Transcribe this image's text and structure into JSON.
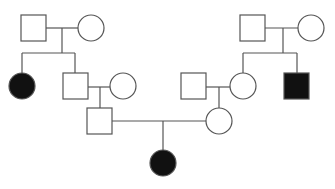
{
  "diagram": {
    "type": "pedigree-chart",
    "colors": {
      "affected": "#111111",
      "unaffected": "#ffffff",
      "stroke": "#555555"
    },
    "individuals": [
      {
        "id": "I-1",
        "sex": "male",
        "affected": false,
        "generation": 1,
        "x": 21,
        "y": 15,
        "size": 25
      },
      {
        "id": "I-2",
        "sex": "female",
        "affected": false,
        "generation": 1,
        "cx": 91,
        "cy": 28,
        "r": 13
      },
      {
        "id": "I-3",
        "sex": "male",
        "affected": false,
        "generation": 1,
        "x": 240,
        "y": 15,
        "size": 25
      },
      {
        "id": "I-4",
        "sex": "female",
        "affected": false,
        "generation": 1,
        "cx": 311,
        "cy": 28,
        "r": 13
      },
      {
        "id": "II-1",
        "sex": "female",
        "affected": true,
        "generation": 2,
        "cx": 22,
        "cy": 86,
        "r": 13
      },
      {
        "id": "II-2",
        "sex": "male",
        "affected": false,
        "generation": 2,
        "x": 63,
        "y": 73,
        "size": 25
      },
      {
        "id": "II-3",
        "sex": "female",
        "affected": false,
        "generation": 2,
        "cx": 123,
        "cy": 86,
        "r": 13
      },
      {
        "id": "II-4",
        "sex": "male",
        "affected": false,
        "generation": 2,
        "x": 181,
        "y": 73,
        "size": 25
      },
      {
        "id": "II-5",
        "sex": "female",
        "affected": false,
        "generation": 2,
        "cx": 243,
        "cy": 86,
        "r": 13
      },
      {
        "id": "II-6",
        "sex": "male",
        "affected": true,
        "generation": 2,
        "x": 284,
        "y": 73,
        "size": 25
      },
      {
        "id": "III-1",
        "sex": "male",
        "affected": false,
        "generation": 3,
        "x": 87,
        "y": 108,
        "size": 25
      },
      {
        "id": "III-2",
        "sex": "female",
        "affected": false,
        "generation": 3,
        "cx": 219,
        "cy": 121,
        "r": 13
      },
      {
        "id": "IV-1",
        "sex": "female",
        "affected": true,
        "generation": 4,
        "cx": 163,
        "cy": 163,
        "r": 13
      }
    ],
    "matings": [
      {
        "partners": [
          "I-1",
          "I-2"
        ],
        "children": [
          "II-1",
          "II-2"
        ]
      },
      {
        "partners": [
          "I-3",
          "I-4"
        ],
        "children": [
          "II-5",
          "II-6"
        ]
      },
      {
        "partners": [
          "II-2",
          "II-3"
        ],
        "children": [
          "III-1"
        ]
      },
      {
        "partners": [
          "II-4",
          "II-5"
        ],
        "children": [
          "III-2"
        ]
      },
      {
        "partners": [
          "III-1",
          "III-2"
        ],
        "children": [
          "IV-1"
        ]
      }
    ]
  }
}
